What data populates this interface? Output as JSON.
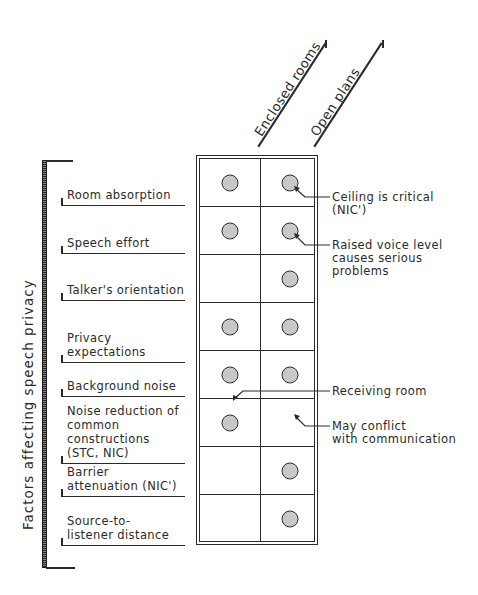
{
  "diagram": {
    "vertical_title": "Factors affecting speech privacy",
    "columns": [
      {
        "label": "Enclosed rooms"
      },
      {
        "label": "Open plans"
      }
    ],
    "rows": [
      {
        "label": "Room absorption",
        "enclosed": true,
        "open": true
      },
      {
        "label": "Speech effort",
        "enclosed": true,
        "open": true
      },
      {
        "label": "Talker's orientation",
        "enclosed": false,
        "open": true
      },
      {
        "label": "Privacy expectations",
        "enclosed": true,
        "open": true
      },
      {
        "label": "Background noise",
        "enclosed": true,
        "open": true
      },
      {
        "label": "Noise reduction of common constructions (STC, NIC)",
        "enclosed": true,
        "open": false
      },
      {
        "label": "Barrier attenuation (NIC')",
        "enclosed": false,
        "open": true
      },
      {
        "label": "Source-to-listener distance",
        "enclosed": false,
        "open": true
      }
    ],
    "row_label_lines": [
      [
        "Room absorption"
      ],
      [
        "Speech effort"
      ],
      [
        "Talker's orientation"
      ],
      [
        "Privacy expectations"
      ],
      [
        "Background noise"
      ],
      [
        "Noise reduction of",
        "common constructions",
        "(STC, NIC)"
      ],
      [
        "Barrier",
        "attenuation (NIC')"
      ],
      [
        "Source-to-",
        "listener distance"
      ]
    ],
    "annotations": [
      {
        "target": "Room absorption / Open plans",
        "lines": [
          "Ceiling is critical",
          "(NIC')"
        ]
      },
      {
        "target": "Speech effort / Open plans",
        "lines": [
          "Raised voice level",
          "causes serious",
          "problems"
        ]
      },
      {
        "target": "Background noise / Enclosed rooms",
        "lines": [
          "Receiving room"
        ]
      },
      {
        "target": "Background noise / Open plans",
        "lines": [
          "May conflict",
          "with communication"
        ]
      }
    ]
  }
}
